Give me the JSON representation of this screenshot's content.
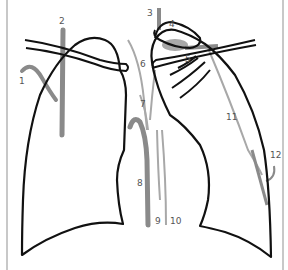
{
  "diagram": {
    "type": "anatomical line drawing",
    "colors": {
      "outline": "#111111",
      "vessel_dark": "#8a8a8a",
      "vessel_light": "#a8a8a8",
      "label": "#555555",
      "frame": "#c8c8c8"
    },
    "labels": [
      {
        "id": "1",
        "text": "1"
      },
      {
        "id": "2",
        "text": "2"
      },
      {
        "id": "3",
        "text": "3"
      },
      {
        "id": "4",
        "text": "4"
      },
      {
        "id": "5",
        "text": "5"
      },
      {
        "id": "6",
        "text": "6"
      },
      {
        "id": "7",
        "text": "7"
      },
      {
        "id": "8",
        "text": "8"
      },
      {
        "id": "9",
        "text": "9"
      },
      {
        "id": "10",
        "text": "10"
      },
      {
        "id": "11",
        "text": "11"
      },
      {
        "id": "12",
        "text": "12"
      }
    ]
  }
}
